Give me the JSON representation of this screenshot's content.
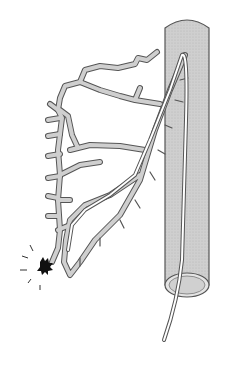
{
  "figure": {
    "type": "medical-illustration",
    "colors": {
      "background": "#ffffff",
      "vessel_fill": "#c8c8c8",
      "vessel_outline": "#555555",
      "catheter": "#ffffff",
      "bleed": "#111111"
    },
    "elements": [
      "main-vessel-tube",
      "catheter",
      "branching-vessels",
      "bleeding-site"
    ]
  }
}
